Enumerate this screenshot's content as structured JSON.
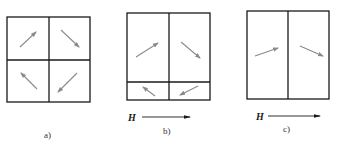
{
  "figure": {
    "panels": [
      {
        "label": "a)",
        "field_label": "",
        "domains": [
          {
            "position": "top-left",
            "magnetization": "up-right"
          },
          {
            "position": "top-right",
            "magnetization": "down-right"
          },
          {
            "position": "bottom-left",
            "magnetization": "up-left"
          },
          {
            "position": "bottom-right",
            "magnetization": "down-left"
          }
        ]
      },
      {
        "label": "b)",
        "field_label": "H",
        "domains": [
          {
            "position": "top-left (large)",
            "magnetization": "up-right"
          },
          {
            "position": "top-right (large)",
            "magnetization": "down-right"
          },
          {
            "position": "bottom-left (small)",
            "magnetization": "up-left"
          },
          {
            "position": "bottom-right (small)",
            "magnetization": "down-left"
          }
        ]
      },
      {
        "label": "c)",
        "field_label": "H",
        "domains": [
          {
            "position": "left",
            "magnetization": "slightly up-right"
          },
          {
            "position": "right",
            "magnetization": "slightly down-right"
          }
        ]
      }
    ],
    "colors": {
      "frame": "#1a1a1a",
      "magnetization_arrow": "#8a8a8a",
      "background": "#ffffff"
    }
  }
}
